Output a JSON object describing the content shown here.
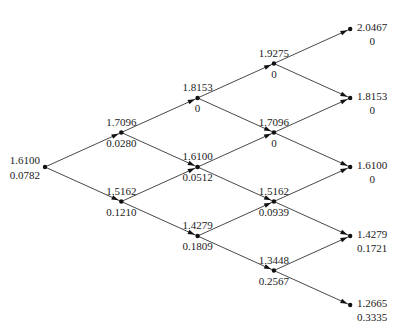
{
  "diagram": {
    "type": "binomial-tree",
    "steps": 4,
    "nodes": [
      {
        "id": "n0_0",
        "step": 0,
        "level": 0,
        "top": "1.6100",
        "bottom": "0.0782"
      },
      {
        "id": "n1_0",
        "step": 1,
        "level": 1,
        "top": "1.7096",
        "bottom": "0.0280"
      },
      {
        "id": "n1_1",
        "step": 1,
        "level": -1,
        "top": "1.5162",
        "bottom": "0.1210"
      },
      {
        "id": "n2_0",
        "step": 2,
        "level": 2,
        "top": "1.8153",
        "bottom": "0"
      },
      {
        "id": "n2_1",
        "step": 2,
        "level": 0,
        "top": "1.6100",
        "bottom": "0.0512"
      },
      {
        "id": "n2_2",
        "step": 2,
        "level": -2,
        "top": "1.4279",
        "bottom": "0.1809"
      },
      {
        "id": "n3_0",
        "step": 3,
        "level": 3,
        "top": "1.9275",
        "bottom": "0"
      },
      {
        "id": "n3_1",
        "step": 3,
        "level": 1,
        "top": "1.7096",
        "bottom": "0"
      },
      {
        "id": "n3_2",
        "step": 3,
        "level": -1,
        "top": "1.5162",
        "bottom": "0.0939"
      },
      {
        "id": "n3_3",
        "step": 3,
        "level": -3,
        "top": "1.3448",
        "bottom": "0.2567"
      },
      {
        "id": "n4_0",
        "step": 4,
        "level": 4,
        "top": "2.0467",
        "bottom": "0"
      },
      {
        "id": "n4_1",
        "step": 4,
        "level": 2,
        "top": "1.8153",
        "bottom": "0"
      },
      {
        "id": "n4_2",
        "step": 4,
        "level": 0,
        "top": "1.6100",
        "bottom": "0"
      },
      {
        "id": "n4_3",
        "step": 4,
        "level": -2,
        "top": "1.4279",
        "bottom": "0.1721"
      },
      {
        "id": "n4_4",
        "step": 4,
        "level": -4,
        "top": "1.2665",
        "bottom": "0.3335"
      }
    ]
  }
}
